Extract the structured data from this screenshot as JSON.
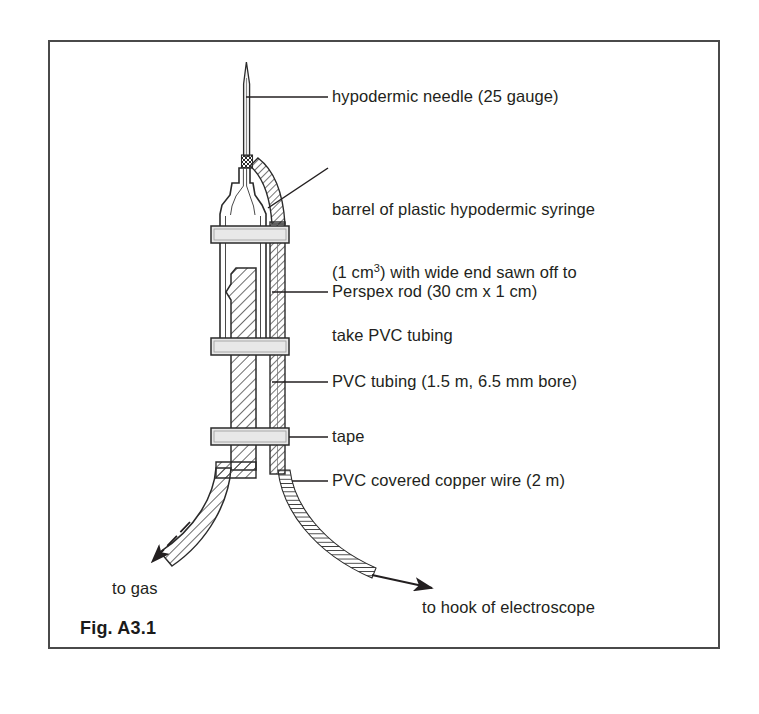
{
  "figure": {
    "caption": "Fig. A3.1",
    "border_color": "#4a4a4a"
  },
  "labels": {
    "needle": "hypodermic needle (25 gauge)",
    "barrel_line1": "barrel of plastic hypodermic syringe",
    "barrel_line2_pre": "(1 cm",
    "barrel_line2_sup": "3",
    "barrel_line2_post": ") with wide end sawn off to",
    "barrel_line3": "take PVC tubing",
    "perspex": "Perspex rod (30 cm x 1 cm)",
    "pvc_tubing": "PVC tubing (1.5 m, 6.5 mm bore)",
    "tape": "tape",
    "wire": "PVC covered copper wire (2 m)",
    "to_gas": "to gas",
    "to_hook": "to hook of electroscope"
  },
  "diagram": {
    "type": "technical-apparatus-cross-section",
    "ink_color": "#231f20",
    "hatch_color": "#3a3a3a",
    "tape_fill": "#e8e8e8",
    "parts": [
      {
        "name": "hypodermic-needle",
        "gauge": "25",
        "orientation": "vertical-top"
      },
      {
        "name": "needle-hub",
        "texture": "cross-hatch"
      },
      {
        "name": "syringe-barrel",
        "volume": "1 cm3",
        "note": "wide end sawn off"
      },
      {
        "name": "perspex-rod",
        "length_cm": 30,
        "diameter_cm": 1,
        "texture": "diagonal-hatch"
      },
      {
        "name": "pvc-tubing",
        "length_m": 1.5,
        "bore_mm": 6.5,
        "texture": "diagonal-hatch"
      },
      {
        "name": "tape-band-upper",
        "texture": "solid-grey"
      },
      {
        "name": "tape-band-middle",
        "texture": "solid-grey"
      },
      {
        "name": "tape-band-lower",
        "texture": "solid-grey"
      },
      {
        "name": "copper-wire",
        "length_m": 2,
        "covering": "PVC",
        "texture": "ladder-hatch"
      }
    ],
    "arrows": [
      {
        "name": "gas-arrow",
        "direction": "down-left",
        "target": "to gas"
      },
      {
        "name": "electroscope-arrow",
        "direction": "down-right",
        "target": "to hook of electroscope"
      }
    ]
  }
}
